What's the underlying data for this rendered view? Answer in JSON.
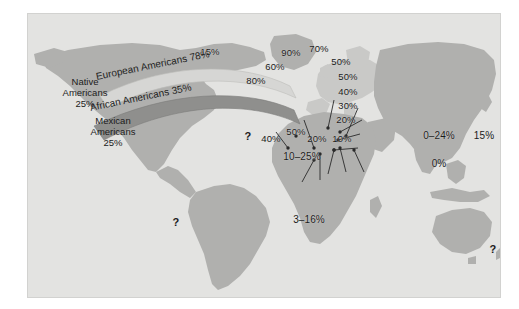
{
  "figure": {
    "type": "thematic-world-map",
    "frame_color": "#e3e3e1",
    "land_color": "#b0b0ae",
    "land_color_light": "#c9c9c7",
    "ocean_color": "#e3e3e1",
    "band_light_color": "#d6d6d4",
    "band_dark_color": "#8f8f8d",
    "text_color": "#1b1b1b"
  },
  "migration_bands": [
    {
      "id": "european-americans",
      "label": "European Americans 78%",
      "name": "European Americans",
      "value": "78%",
      "shade": "light"
    },
    {
      "id": "african-americans",
      "label": "African Americans 35%",
      "name": "African Americans",
      "value": "35%",
      "shade": "dark"
    }
  ],
  "america_groups": [
    {
      "id": "native-americans",
      "line1": "Native",
      "line2": "Americans",
      "value": "25%"
    },
    {
      "id": "mexican-americans",
      "line1": "Mexican",
      "line2": "Americans",
      "value": "25%"
    }
  ],
  "map_labels": [
    {
      "id": "canada",
      "text": "15%"
    },
    {
      "id": "iberia",
      "text": "80%"
    },
    {
      "id": "france",
      "text": "60%"
    },
    {
      "id": "britain",
      "text": "90%"
    },
    {
      "id": "scandinavia",
      "text": "70%"
    },
    {
      "id": "baltic",
      "text": "50%"
    },
    {
      "id": "central-europe",
      "text": "50%"
    },
    {
      "id": "eastern-europe",
      "text": "40%"
    },
    {
      "id": "balkans",
      "text": "30%"
    },
    {
      "id": "anatolia",
      "text": "20%"
    },
    {
      "id": "north-africa-west",
      "text": "?"
    },
    {
      "id": "morocco",
      "text": "40%"
    },
    {
      "id": "italy-south",
      "text": "50%"
    },
    {
      "id": "egypt",
      "text": "20%"
    },
    {
      "id": "arabia",
      "text": "10%"
    },
    {
      "id": "sahel",
      "text": "10–25%"
    },
    {
      "id": "sub-saharan-africa",
      "text": "3–16%"
    },
    {
      "id": "south-america",
      "text": "?"
    },
    {
      "id": "china",
      "text": "0–24%"
    },
    {
      "id": "japan",
      "text": "15%"
    },
    {
      "id": "southeast-china",
      "text": "0%"
    },
    {
      "id": "australia",
      "text": "?"
    }
  ]
}
